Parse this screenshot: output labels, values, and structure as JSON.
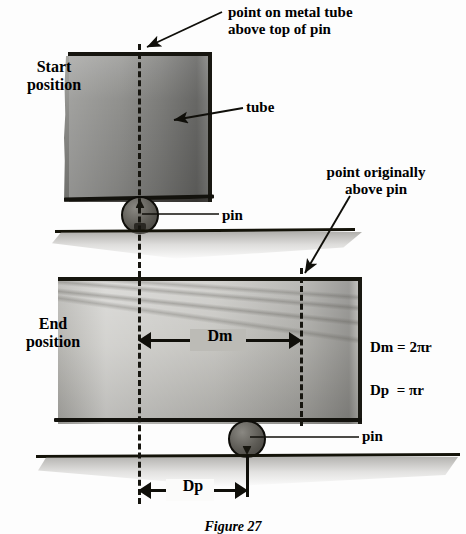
{
  "figure": {
    "caption": "Figure 27",
    "labels": {
      "point_on_metal_tube": "point on metal tube\nabove top of pin",
      "start_position": "Start\nposition",
      "tube": "tube",
      "pin_start": "pin",
      "point_originally_above_pin": "point originally\nabove pin",
      "end_position": "End\nposition",
      "pin_end": "pin"
    },
    "dimensions": {
      "dm": "Dm",
      "dp": "Dp"
    },
    "equations": [
      "Dm = 2πr",
      "Dp  = πr"
    ],
    "colors": {
      "ink": "#100f0a",
      "tube_start_fill": "#8d8d8a",
      "tube_end_fill": "#b9b8b3",
      "pin_fill": "#5d5b55",
      "paper": "#fdfdfd"
    }
  }
}
